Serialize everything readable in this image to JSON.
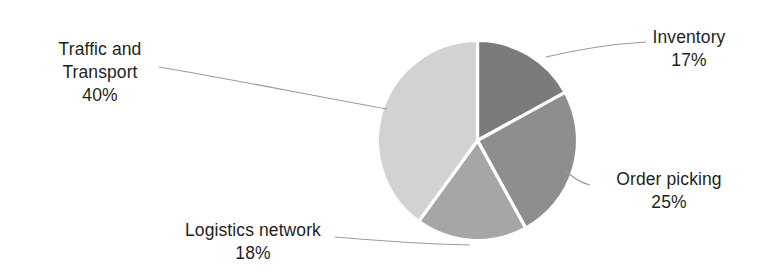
{
  "chart_data": {
    "type": "pie",
    "title": "",
    "subtitle": "",
    "xlabel": "",
    "ylabel": "",
    "legend_position": "none",
    "grid": false,
    "label_format": "name-above-percent",
    "start_angle_deg": 0,
    "direction": "clockwise",
    "categories": [
      "Inventory",
      "Order picking",
      "Logistics network",
      "Traffic and Transport"
    ],
    "values": [
      17,
      25,
      18,
      40
    ],
    "value_unit": "%",
    "slices": [
      {
        "label": "Inventory",
        "value": 17,
        "value_text": "17%",
        "color": "#7b7b7b",
        "start_deg": 0,
        "end_deg": 61.2
      },
      {
        "label": "Order picking",
        "value": 25,
        "value_text": "25%",
        "color": "#8e8e8e",
        "start_deg": 61.2,
        "end_deg": 151.2
      },
      {
        "label": "Logistics network",
        "value": 18,
        "value_text": "18%",
        "color": "#a6a6a6",
        "start_deg": 151.2,
        "end_deg": 216.0
      },
      {
        "label": "Traffic and Transport",
        "value": 40,
        "value_text": "40%",
        "color": "#d2d2d2",
        "start_deg": 216.0,
        "end_deg": 360.0
      }
    ]
  },
  "labels": {
    "inventory": {
      "name": "Inventory",
      "value": "17%"
    },
    "order_picking": {
      "name": "Order picking",
      "value": "25%"
    },
    "logistics_network": {
      "name": "Logistics network",
      "value": "18%"
    },
    "traffic_transport": {
      "name_line1": "Traffic and",
      "name_line2": "Transport",
      "value": "40%"
    }
  },
  "colors": {
    "background": "#ffffff",
    "text": "#231f20",
    "leader_line": "#9a9a9a",
    "slice_border": "#ffffff"
  }
}
